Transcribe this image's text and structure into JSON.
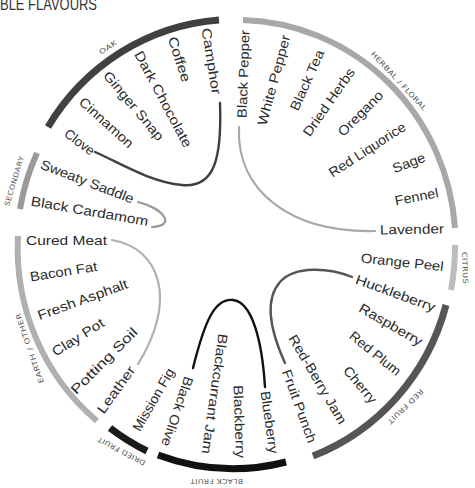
{
  "title": "BLE FLAVOURS",
  "groups": [
    {
      "name": "OAK",
      "color": "#404040",
      "items": [
        "Camphor",
        "Coffee",
        "Dark Chocolate",
        "Ginger Snap",
        "Cinnamon",
        "Clove"
      ]
    },
    {
      "name": "HERBAL / FLORAL",
      "color": "#a8a8a8",
      "items": [
        "Black Pepper",
        "White Pepper",
        "Black Tea",
        "Dried Herbs",
        "Oregano",
        "Red Liquorice",
        "Sage",
        "Fennel",
        "Lavender"
      ]
    },
    {
      "name": "CITRUS",
      "color": "#bdbdbd",
      "items": [
        "Orange Peel"
      ]
    },
    {
      "name": "RED FRUIT",
      "color": "#555555",
      "items": [
        "Huckleberry",
        "Raspberry",
        "Red Plum",
        "Cherry",
        "Red-Berry Jam",
        "Fruit Punch"
      ]
    },
    {
      "name": "BLACK FRUIT",
      "color": "#111111",
      "items": [
        "Blueberry",
        "Blackberry",
        "Blackcurrant Jam",
        "Black Olive"
      ]
    },
    {
      "name": "DRIED FRUIT",
      "color": "#1a1a1a",
      "items": [
        "Mission Fig"
      ]
    },
    {
      "name": "EARTH / OTHER",
      "color": "#b0b0b0",
      "items": [
        "Cured Meat",
        "Bacon Fat",
        "Fresh Asphalt",
        "Clay Pot",
        "Potting Soil",
        "Leather"
      ]
    },
    {
      "name": "SECONDARY",
      "color": "#9a9a9a",
      "items": [
        "Sweaty Saddle",
        "Black Cardamom"
      ]
    }
  ]
}
